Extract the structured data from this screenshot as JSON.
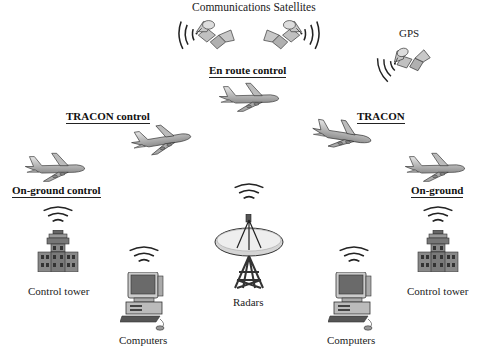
{
  "diagram": {
    "satellites": {
      "communications_label": "Communications Satellites",
      "gps_label": "GPS"
    },
    "zones": {
      "en_route": "En route control",
      "tracon_left": "TRACON control",
      "tracon_right": "TRACON",
      "on_ground_left": "On-ground control",
      "on_ground_right": "On-ground"
    },
    "ground_stations": {
      "control_tower_left": "Control tower",
      "computers_left": "Computers",
      "radars": "Radars",
      "computers_right": "Computers",
      "control_tower_right": "Control tower"
    },
    "icons": [
      "satellite-icon",
      "airplane-icon",
      "control-tower-icon",
      "computer-icon",
      "radar-dish-icon",
      "signal-waves-icon"
    ],
    "colors": {
      "background": "#ffffff",
      "icon_fill": "#b8b8b8",
      "icon_stroke": "#333333",
      "text": "#222222"
    }
  }
}
